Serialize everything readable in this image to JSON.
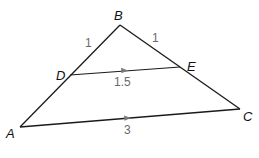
{
  "diagram": {
    "type": "triangle-midsegment",
    "colors": {
      "line": "#1a1a1a",
      "arrow": "#7a7a7a",
      "vertex_label": "#111111",
      "measure_label": "#6a6a6a"
    },
    "vertices": {
      "A": {
        "label": "A",
        "x": 20,
        "y": 127
      },
      "B": {
        "label": "B",
        "x": 120,
        "y": 25
      },
      "C": {
        "label": "C",
        "x": 240,
        "y": 109
      },
      "D": {
        "label": "D",
        "x": 70,
        "y": 75
      },
      "E": {
        "label": "E",
        "x": 180,
        "y": 67
      }
    },
    "segments": [
      {
        "from": "A",
        "to": "B"
      },
      {
        "from": "B",
        "to": "C"
      },
      {
        "from": "A",
        "to": "C",
        "parallel_arrow": true
      },
      {
        "from": "D",
        "to": "E",
        "parallel_arrow": true
      }
    ],
    "measures": {
      "BD": "1",
      "BE": "1",
      "DE": "1.5",
      "AC": "3"
    }
  }
}
